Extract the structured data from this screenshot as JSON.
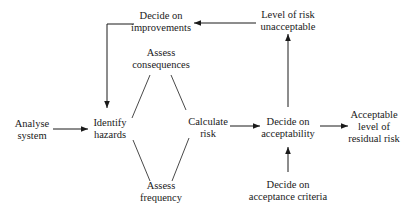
{
  "diagram": {
    "nodes": {
      "decide_improvements": {
        "line1": "Decide on",
        "line2": "improvements"
      },
      "level_unacceptable": {
        "line1": "Level of risk",
        "line2": "unacceptable"
      },
      "assess_consequences": {
        "line1": "Assess",
        "line2": "consequences"
      },
      "analyse_system": {
        "line1": "Analyse",
        "line2": "system"
      },
      "identify_hazards": {
        "line1": "Identify",
        "line2": "hazards"
      },
      "calculate_risk": {
        "line1": "Calculate",
        "line2": "risk"
      },
      "decide_acceptability": {
        "line1": "Decide on",
        "line2": "acceptability"
      },
      "acceptable_residual": {
        "line1": "Acceptable",
        "line2": "level of",
        "line3": "residual risk"
      },
      "assess_frequency": {
        "line1": "Assess",
        "line2": "frequency"
      },
      "decide_criteria": {
        "line1": "Decide on",
        "line2": "acceptance criteria"
      }
    },
    "edges": [
      {
        "from": "Analyse system",
        "to": "Identify hazards",
        "type": "arrow"
      },
      {
        "from": "Identify hazards",
        "to": "Assess consequences",
        "type": "line"
      },
      {
        "from": "Identify hazards",
        "to": "Assess frequency",
        "type": "line"
      },
      {
        "from": "Assess consequences",
        "to": "Calculate risk",
        "type": "line"
      },
      {
        "from": "Assess frequency",
        "to": "Calculate risk",
        "type": "line"
      },
      {
        "from": "Calculate risk",
        "to": "Decide on acceptability",
        "type": "arrow"
      },
      {
        "from": "Decide on acceptability",
        "to": "Acceptable level of residual risk",
        "type": "arrow"
      },
      {
        "from": "Decide on acceptance criteria",
        "to": "Decide on acceptability",
        "type": "arrow"
      },
      {
        "from": "Decide on acceptability",
        "to": "Level of risk unacceptable",
        "type": "arrow"
      },
      {
        "from": "Level of risk unacceptable",
        "to": "Decide on improvements",
        "type": "arrow"
      },
      {
        "from": "Decide on improvements",
        "to": "Identify hazards",
        "type": "arrow"
      }
    ],
    "colors": {
      "line": "#1a1a1a",
      "background": "#ffffff"
    }
  }
}
